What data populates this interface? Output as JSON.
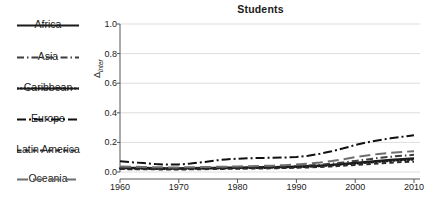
{
  "chart_data": {
    "type": "line",
    "title": "Students",
    "xlabel": "",
    "ylabel": "Δinter",
    "ylabel_base": "Δ",
    "ylabel_sub": "inter",
    "xlim": [
      1960,
      2010
    ],
    "ylim": [
      0.0,
      1.0
    ],
    "grid": true,
    "grid_axis": "y",
    "legend_position": "left-outside",
    "xticks": [
      1960,
      1970,
      1980,
      1990,
      2000,
      2010
    ],
    "xtick_labels": [
      "1960",
      "1970",
      "1980",
      "1990",
      "2000",
      "2010"
    ],
    "yticks": [
      0.0,
      0.2,
      0.4,
      0.6,
      0.8,
      1.0
    ],
    "ytick_labels": [
      "0.0",
      "0.2",
      "0.4",
      "0.6",
      "0.8",
      "1.0"
    ],
    "x": [
      1960,
      1962,
      1964,
      1966,
      1968,
      1970,
      1972,
      1974,
      1976,
      1978,
      1980,
      1982,
      1984,
      1986,
      1988,
      1990,
      1992,
      1994,
      1996,
      1998,
      2000,
      2002,
      2004,
      2006,
      2008,
      2010
    ],
    "series": [
      {
        "name": "Africa",
        "style": "solid",
        "color": "#1b1b1b",
        "values": [
          0.03,
          0.029,
          0.028,
          0.027,
          0.026,
          0.026,
          0.027,
          0.028,
          0.029,
          0.03,
          0.031,
          0.032,
          0.033,
          0.034,
          0.035,
          0.037,
          0.04,
          0.044,
          0.049,
          0.055,
          0.062,
          0.069,
          0.076,
          0.082,
          0.088,
          0.093
        ]
      },
      {
        "name": "Asia",
        "style": "dash-dot",
        "color": "#3d3d3d",
        "values": [
          0.028,
          0.027,
          0.026,
          0.025,
          0.024,
          0.024,
          0.025,
          0.026,
          0.027,
          0.028,
          0.029,
          0.03,
          0.032,
          0.034,
          0.036,
          0.039,
          0.043,
          0.049,
          0.056,
          0.065,
          0.075,
          0.085,
          0.095,
          0.103,
          0.11,
          0.116
        ]
      },
      {
        "name": "Caribbean",
        "style": "dotted",
        "color": "#1b1b1b",
        "values": [
          0.024,
          0.023,
          0.022,
          0.021,
          0.021,
          0.021,
          0.022,
          0.023,
          0.024,
          0.025,
          0.026,
          0.027,
          0.028,
          0.029,
          0.031,
          0.033,
          0.036,
          0.04,
          0.045,
          0.051,
          0.057,
          0.063,
          0.069,
          0.075,
          0.08,
          0.084
        ]
      },
      {
        "name": "Europe",
        "style": "dash-dot-long",
        "color": "#111111",
        "values": [
          0.072,
          0.066,
          0.06,
          0.054,
          0.05,
          0.051,
          0.057,
          0.066,
          0.077,
          0.085,
          0.09,
          0.093,
          0.095,
          0.096,
          0.098,
          0.102,
          0.11,
          0.123,
          0.14,
          0.16,
          0.182,
          0.2,
          0.215,
          0.228,
          0.238,
          0.248
        ]
      },
      {
        "name": "Latin America",
        "style": "dashed",
        "color": "#2a2a2a",
        "values": [
          0.02,
          0.019,
          0.018,
          0.018,
          0.017,
          0.017,
          0.018,
          0.019,
          0.02,
          0.021,
          0.022,
          0.023,
          0.024,
          0.025,
          0.027,
          0.029,
          0.031,
          0.034,
          0.038,
          0.043,
          0.048,
          0.053,
          0.058,
          0.063,
          0.067,
          0.07
        ]
      },
      {
        "name": "Oceania",
        "style": "long-dash",
        "color": "#6e6e6e",
        "values": [
          0.038,
          0.036,
          0.034,
          0.032,
          0.031,
          0.031,
          0.032,
          0.033,
          0.035,
          0.036,
          0.038,
          0.039,
          0.041,
          0.043,
          0.046,
          0.05,
          0.056,
          0.064,
          0.074,
          0.086,
          0.1,
          0.112,
          0.122,
          0.13,
          0.136,
          0.14
        ]
      }
    ]
  },
  "legend": {
    "items": [
      {
        "label": "Africa",
        "style": "solid"
      },
      {
        "label": "Asia",
        "style": "dash-dot"
      },
      {
        "label": "Caribbean",
        "style": "dotted"
      },
      {
        "label": "Europe",
        "style": "dash-dot-long"
      },
      {
        "label": "Latin America",
        "style": "dashed"
      },
      {
        "label": "Oceania",
        "style": "long-dash"
      }
    ]
  },
  "colors": {
    "background": "#ffffff",
    "axis": "#555555",
    "grid": "#d9d9d9",
    "text": "#1b1b1b"
  }
}
